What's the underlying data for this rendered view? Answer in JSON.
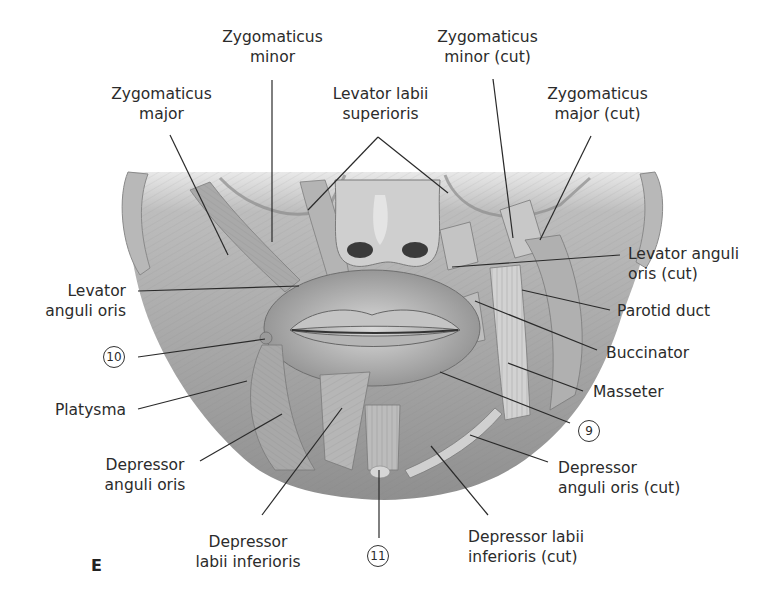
{
  "figure": {
    "panel_letter": "E",
    "colors": {
      "background": "#ffffff",
      "text": "#2b2b2b",
      "leader_line": "#2a2a2a",
      "illustration_base": "#9a9a9a"
    }
  },
  "labels": {
    "zygomaticus_minor": {
      "line1": "Zygomaticus",
      "line2": "minor"
    },
    "zygomaticus_major": {
      "line1": "Zygomaticus",
      "line2": "major"
    },
    "levator_labii_superioris": {
      "line1": "Levator labii",
      "line2": "superioris"
    },
    "zygomaticus_minor_cut": {
      "line1": "Zygomaticus",
      "line2": "minor (cut)"
    },
    "zygomaticus_major_cut": {
      "line1": "Zygomaticus",
      "line2": "major (cut)"
    },
    "levator_anguli_oris_cut": {
      "line1": "Levator anguli",
      "line2": "oris (cut)"
    },
    "parotid_duct": {
      "line1": "Parotid duct"
    },
    "buccinator": {
      "line1": "Buccinator"
    },
    "masseter": {
      "line1": "Masseter"
    },
    "levator_anguli_oris": {
      "line1": "Levator",
      "line2": "anguli oris"
    },
    "platysma": {
      "line1": "Platysma"
    },
    "depressor_anguli_oris": {
      "line1": "Depressor",
      "line2": "anguli oris"
    },
    "depressor_labii_inferioris": {
      "line1": "Depressor",
      "line2": "labii inferioris"
    },
    "depressor_anguli_oris_cut": {
      "line1": "Depressor",
      "line2": "anguli oris (cut)"
    },
    "depressor_labii_inferioris_cut": {
      "line1": "Depressor labii",
      "line2": "inferioris (cut)"
    }
  },
  "numbered_markers": [
    {
      "id": "marker-9",
      "text": "9"
    },
    {
      "id": "marker-10",
      "text": "10"
    },
    {
      "id": "marker-11",
      "text": "11"
    }
  ]
}
